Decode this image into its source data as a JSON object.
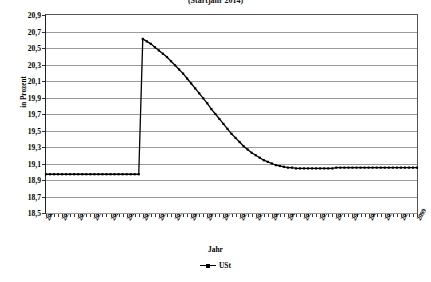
{
  "chart_title": "(Startjahr 2014)",
  "axes": {
    "y_title": "in Prozent",
    "x_title": "Jahr",
    "y_ticks": [
      "20,9",
      "20,7",
      "20,5",
      "20,3",
      "20,1",
      "19,9",
      "19,7",
      "19,5",
      "19,3",
      "19,1",
      "18,9",
      "18,7",
      "18,5"
    ],
    "x_ticks": [
      "2007",
      "2011",
      "2015",
      "2019",
      "2023",
      "2027",
      "2031",
      "2035",
      "2039",
      "2043",
      "2047",
      "2051",
      "2055",
      "2059",
      "2063",
      "2067",
      "2071",
      "2075",
      "2079",
      "2083",
      "2087",
      "2091",
      "2095",
      "2099"
    ]
  },
  "legend": {
    "entries": [
      {
        "label": "USt",
        "symbol": "line-square-marker-icon",
        "color": "#000000"
      }
    ]
  },
  "colors": {
    "series": "#000000",
    "grid": "#9a9a9a",
    "frame": "#555555",
    "background": "#ffffff"
  },
  "chart_data": {
    "type": "line",
    "title": "(Startjahr 2014)",
    "xlabel": "Jahr",
    "ylabel": "in Prozent",
    "ylim": [
      18.5,
      20.9
    ],
    "xlim": [
      2007,
      2099
    ],
    "ytick_step": 0.2,
    "xtick_step": 4,
    "grid": true,
    "legend_position": "bottom",
    "marker": "square",
    "series": [
      {
        "name": "USt",
        "x": [
          2007,
          2008,
          2009,
          2010,
          2011,
          2012,
          2013,
          2014,
          2015,
          2016,
          2017,
          2018,
          2019,
          2020,
          2021,
          2022,
          2023,
          2024,
          2025,
          2026,
          2027,
          2028,
          2029,
          2030,
          2031,
          2032,
          2033,
          2034,
          2035,
          2036,
          2037,
          2038,
          2039,
          2040,
          2041,
          2042,
          2043,
          2044,
          2045,
          2046,
          2047,
          2048,
          2049,
          2050,
          2051,
          2052,
          2053,
          2054,
          2055,
          2056,
          2057,
          2058,
          2059,
          2060,
          2061,
          2062,
          2063,
          2064,
          2065,
          2066,
          2067,
          2068,
          2069,
          2070,
          2071,
          2072,
          2073,
          2074,
          2075,
          2076,
          2077,
          2078,
          2079,
          2080,
          2081,
          2082,
          2083,
          2084,
          2085,
          2086,
          2087,
          2088,
          2089,
          2090,
          2091,
          2092,
          2093,
          2094,
          2095,
          2096,
          2097,
          2098,
          2099
        ],
        "y": [
          18.97,
          18.97,
          18.97,
          18.97,
          18.97,
          18.97,
          18.97,
          18.97,
          18.97,
          18.97,
          18.97,
          18.97,
          18.97,
          18.97,
          18.97,
          18.97,
          18.97,
          18.97,
          18.97,
          18.97,
          18.97,
          18.97,
          18.97,
          18.97,
          20.61,
          20.58,
          20.55,
          20.51,
          20.47,
          20.43,
          20.39,
          20.34,
          20.29,
          20.24,
          20.19,
          20.13,
          20.07,
          20.01,
          19.95,
          19.89,
          19.83,
          19.76,
          19.7,
          19.64,
          19.58,
          19.52,
          19.46,
          19.41,
          19.36,
          19.31,
          19.27,
          19.23,
          19.2,
          19.17,
          19.14,
          19.12,
          19.1,
          19.08,
          19.07,
          19.06,
          19.05,
          19.05,
          19.04,
          19.04,
          19.04,
          19.04,
          19.04,
          19.04,
          19.04,
          19.04,
          19.04,
          19.04,
          19.05,
          19.05,
          19.05,
          19.05,
          19.05,
          19.05,
          19.05,
          19.05,
          19.05,
          19.05,
          19.05,
          19.05,
          19.05,
          19.05,
          19.05,
          19.05,
          19.05,
          19.05,
          19.05,
          19.05,
          19.05
        ]
      }
    ]
  }
}
